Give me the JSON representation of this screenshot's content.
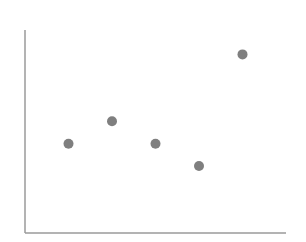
{
  "chart_data": {
    "type": "scatter",
    "title": "",
    "xlabel": "",
    "ylabel": "",
    "xlim": [
      0,
      6
    ],
    "ylim": [
      0,
      10
    ],
    "grid": false,
    "legend": null,
    "tick_labels_visible": false,
    "series": [
      {
        "name": "points",
        "color": "#7f7f7f",
        "points": [
          {
            "x": 1,
            "y": 4.4
          },
          {
            "x": 2,
            "y": 5.5
          },
          {
            "x": 3,
            "y": 4.4
          },
          {
            "x": 4,
            "y": 3.3
          },
          {
            "x": 5,
            "y": 8.8
          }
        ]
      }
    ]
  },
  "style": {
    "axis_color": "#9a9a9a",
    "point_color": "#7f7f7f",
    "point_radius": 5
  },
  "layout": {
    "plot_left": 25,
    "plot_right": 286,
    "plot_top": 30,
    "plot_bottom": 233
  }
}
